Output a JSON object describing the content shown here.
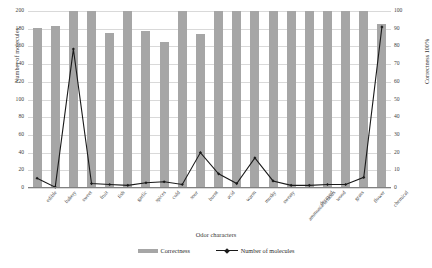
{
  "chart_data": {
    "type": "bar",
    "title": "",
    "xlabel": "Odor characters",
    "ylabel": "Number of molecules",
    "ylabel_secondary": "Correctness 100%",
    "ylim": [
      0,
      200
    ],
    "ylim_secondary": [
      0,
      100
    ],
    "ytick_labels": [
      "0",
      "20",
      "40",
      "60",
      "80",
      "100",
      "120",
      "140",
      "160",
      "180",
      "200"
    ],
    "ytick_labels_secondary": [
      "0",
      "10",
      "20",
      "30",
      "40",
      "50",
      "60",
      "70",
      "80",
      "90",
      "100"
    ],
    "grid": true,
    "legend_position": "bottom",
    "categories": [
      "edible",
      "bakery",
      "sweet",
      "fruit",
      "fish",
      "garlic",
      "spices",
      "cold",
      "sour",
      "burnt",
      "acid",
      "warm",
      "musky",
      "sweaty",
      "ammonia/urinous",
      "decayed",
      "wood",
      "grass",
      "flower",
      "chemical"
    ],
    "series": [
      {
        "name": "Correctness",
        "type": "bar",
        "axis": "right",
        "values": [
          90.5,
          91.5,
          100,
          100,
          87.5,
          100,
          88.5,
          82.5,
          100,
          87,
          100,
          100,
          100,
          100,
          100,
          100,
          100,
          100,
          100,
          92.5
        ]
      },
      {
        "name": "Number of molecules",
        "type": "line",
        "axis": "left",
        "values": [
          11,
          1,
          157,
          5,
          4,
          3,
          6,
          7,
          4,
          40,
          16,
          5,
          34,
          8,
          3,
          3,
          4,
          4,
          12,
          182
        ]
      }
    ]
  },
  "legend": {
    "items": [
      {
        "label": "Correctness",
        "marker": "bar",
        "color": "#a6a6a6"
      },
      {
        "label": "Number of molecules",
        "marker": "line",
        "color": "#1a1a1a"
      }
    ]
  }
}
